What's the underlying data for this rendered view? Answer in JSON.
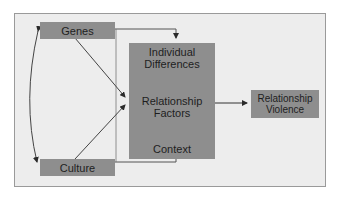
{
  "diagram": {
    "nodes": {
      "genes": "Genes",
      "culture": "Culture",
      "individual_differences": "Individual Differences",
      "individual_line1": "Individual",
      "individual_line2": "Differences",
      "relationship_factors_line1": "Relationship",
      "relationship_factors_line2": "Factors",
      "context": "Context",
      "violence_line1": "Relationship",
      "violence_line2": "Violence"
    },
    "edges": [
      {
        "from": "Genes",
        "to": "Culture",
        "type": "bidirectional-curve"
      },
      {
        "from": "Genes",
        "to": "Individual Differences",
        "type": "arrow"
      },
      {
        "from": "Genes",
        "to": "Relationship Factors",
        "type": "arrow"
      },
      {
        "from": "Culture",
        "to": "Relationship Factors",
        "type": "arrow"
      },
      {
        "from": "Culture",
        "to": "Context",
        "type": "arrow"
      },
      {
        "from": "Individual Differences",
        "to": "Relationship Factors",
        "type": "bidirectional"
      },
      {
        "from": "Context",
        "to": "Relationship Factors",
        "type": "bidirectional"
      },
      {
        "from": "Relationship Factors",
        "to": "Relationship Violence",
        "type": "arrow"
      }
    ],
    "colors": {
      "box_fill": "#8e8e8e",
      "frame_fill": "#ededed",
      "line": "#3a3a3a"
    }
  }
}
